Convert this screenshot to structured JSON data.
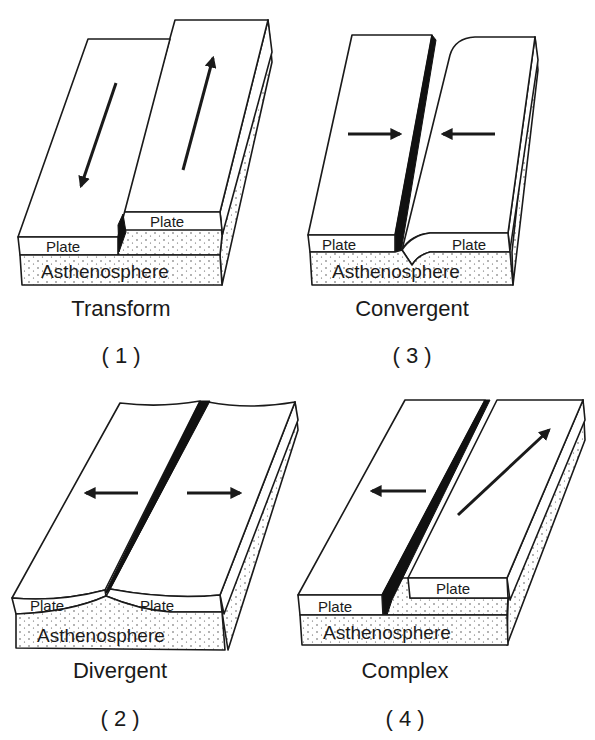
{
  "figure": {
    "panels": [
      {
        "id": "transform",
        "caption": "Transform",
        "number": "( 1 )",
        "plate_labels": [
          "Plate",
          "Plate"
        ],
        "layer_label": "Asthenosphere",
        "motion": "plates slide past each other (left plate moves down, right plate moves up)"
      },
      {
        "id": "divergent",
        "caption": "Divergent",
        "number": "( 2 )",
        "plate_labels": [
          "Plate",
          "Plate"
        ],
        "layer_label": "Asthenosphere",
        "motion": "plates move apart (left arrow points left, right arrow points right)"
      },
      {
        "id": "convergent",
        "caption": "Convergent",
        "number": "( 3 )",
        "plate_labels": [
          "Plate",
          "Plate"
        ],
        "layer_label": "Asthenosphere",
        "motion": "plates move toward each other (arrows point inward)"
      },
      {
        "id": "complex",
        "caption": "Complex",
        "number": "( 4 )",
        "plate_labels": [
          "Plate",
          "Plate"
        ],
        "layer_label": "Asthenosphere",
        "motion": "left plate moves left, right plate moves diagonally up-right"
      }
    ]
  },
  "colors": {
    "ink": "#1a1a1a",
    "background": "#ffffff",
    "rift": "#111111"
  }
}
